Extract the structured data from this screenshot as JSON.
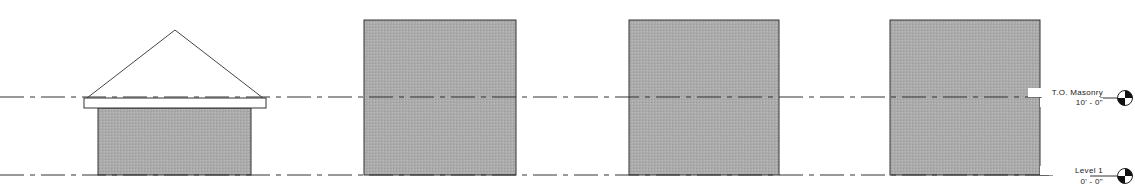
{
  "view": {
    "type": "elevation",
    "colors": {
      "background": "#ffffff",
      "line": "#333333",
      "masonry_fill": "#a9a9a9",
      "slab_fill": "#ffffff"
    }
  },
  "levels": [
    {
      "name": "T.O. Masonry",
      "elevation": "10' - 0\"",
      "y": 97
    },
    {
      "name": "Level 1",
      "elevation": "0' - 0\"",
      "y": 175
    }
  ],
  "elements": [
    {
      "id": "house",
      "kind": "wall-with-slab-and-roof",
      "wall": [
        98,
        108,
        153,
        67
      ],
      "slab": [
        84,
        98,
        182,
        10
      ],
      "roof_apex": [
        175,
        30
      ]
    },
    {
      "id": "block-2",
      "kind": "masonry-mass",
      "rect": [
        364,
        20,
        152,
        155
      ]
    },
    {
      "id": "block-3",
      "kind": "masonry-mass",
      "rect": [
        629,
        20,
        150,
        155
      ]
    },
    {
      "id": "block-4",
      "kind": "masonry-mass",
      "rect": [
        890,
        20,
        150,
        155
      ]
    }
  ]
}
